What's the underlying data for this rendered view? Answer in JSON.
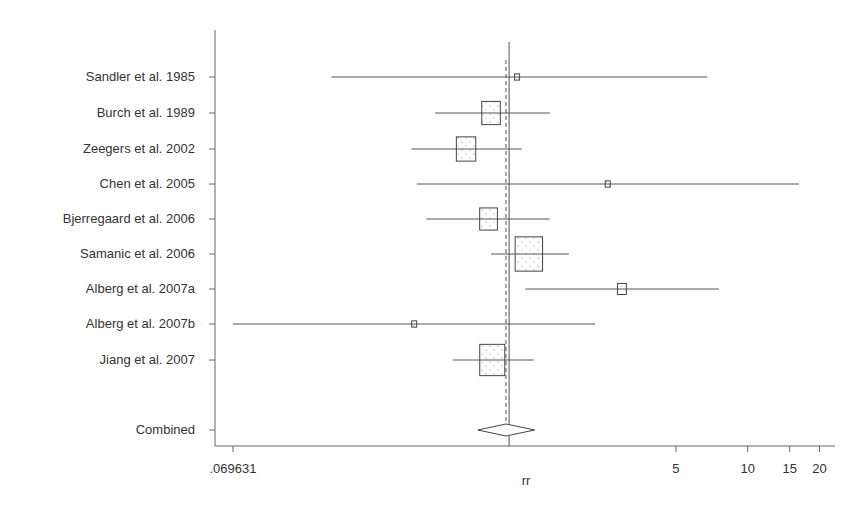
{
  "chart_data": {
    "type": "forest",
    "title": "",
    "xlabel": "rr",
    "ylabel": "",
    "x_scale": "log",
    "xlim": [
      0.069631,
      22
    ],
    "x_ticks": [
      {
        "value": 0.069631,
        "label": ".069631"
      },
      {
        "value": 5,
        "label": "5"
      },
      {
        "value": 10,
        "label": "10"
      },
      {
        "value": 15,
        "label": "15"
      },
      {
        "value": 20,
        "label": "20"
      }
    ],
    "null_line": 1.0,
    "pooled_line": 0.97,
    "studies": [
      {
        "label": "Sandler et al. 1985",
        "rr": 1.08,
        "lower": 0.18,
        "upper": 6.76,
        "weight": 0.5
      },
      {
        "label": "Burch et al. 1989",
        "rr": 0.84,
        "lower": 0.49,
        "upper": 1.48,
        "weight": 11
      },
      {
        "label": "Zeegers et al. 2002",
        "rr": 0.66,
        "lower": 0.39,
        "upper": 1.13,
        "weight": 12
      },
      {
        "label": "Chen et al. 2005",
        "rr": 2.59,
        "lower": 0.41,
        "upper": 16.4,
        "weight": 0.5
      },
      {
        "label": "Bjerregaard et al. 2006",
        "rr": 0.82,
        "lower": 0.45,
        "upper": 1.48,
        "weight": 10
      },
      {
        "label": "Samanic et al. 2006",
        "rr": 1.21,
        "lower": 0.84,
        "upper": 1.78,
        "weight": 24
      },
      {
        "label": "Alberg et al. 2007a",
        "rr": 2.97,
        "lower": 1.17,
        "upper": 7.58,
        "weight": 2.5
      },
      {
        "label": "Alberg et al. 2007b",
        "rr": 0.4,
        "lower": 0.0696,
        "upper": 2.29,
        "weight": 0.5
      },
      {
        "label": "Jiang et al. 2007",
        "rr": 0.85,
        "lower": 0.58,
        "upper": 1.27,
        "weight": 20
      }
    ],
    "combined": {
      "label": "Combined",
      "rr": 0.97,
      "lower": 0.74,
      "upper": 1.28
    }
  }
}
